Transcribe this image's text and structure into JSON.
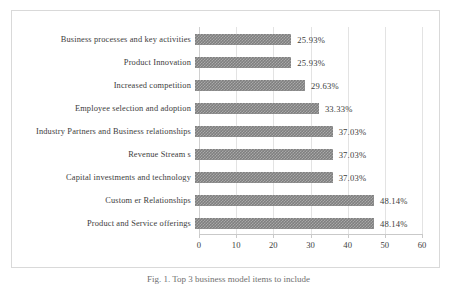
{
  "figure": {
    "caption": "Fig. 1. Top 3 business model items to include"
  },
  "chart_data": {
    "type": "bar",
    "orientation": "horizontal",
    "title": "",
    "xlabel": "",
    "ylabel": "",
    "xlim": [
      0,
      60
    ],
    "xticks": [
      "0",
      "10",
      "20",
      "30",
      "40",
      "50",
      "60"
    ],
    "grid": true,
    "legend": "none",
    "bar_color": "#7f7f7f",
    "categories": [
      "Business processes and key activities",
      "Product Innovation",
      "Increased competition",
      "Employee selection and adoption",
      "Industry Partners and Business relationships",
      "Revenue Stream s",
      "Capital investments and technology",
      "Custom er Relationships",
      "Product and Service offerings"
    ],
    "values": [
      25.93,
      25.93,
      29.63,
      33.33,
      37.03,
      37.03,
      37.03,
      48.14,
      48.14
    ],
    "data_labels": [
      "25.93%",
      "25.93%",
      "29.63%",
      "33.33%",
      "37.03%",
      "37.03%",
      "37.03%",
      "48.14%",
      "48.14%"
    ]
  }
}
